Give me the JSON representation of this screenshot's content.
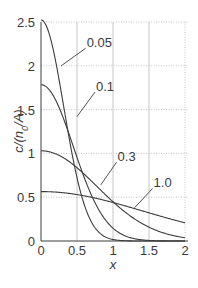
{
  "chart_data": {
    "type": "line",
    "title": "",
    "xlabel": "x",
    "ylabel": "c/(n0/A)",
    "xlim": [
      0,
      2
    ],
    "ylim": [
      0,
      2.5
    ],
    "x_ticks": [
      "0",
      "0.5",
      "1",
      "1.5",
      "2"
    ],
    "y_ticks": [
      "0",
      "0.5",
      "1",
      "1.5",
      "2",
      "2.5"
    ],
    "grid": true,
    "legend": "inline labels",
    "series": [
      {
        "name": "0.05",
        "param": 0.05,
        "peak": 2.52,
        "values_at_x": {
          "0": 2.52,
          "0.25": 1.84,
          "0.5": 0.72,
          "0.75": 0.15,
          "1": 0.02,
          "1.5": 0.0,
          "2": 0.0
        }
      },
      {
        "name": "0.1",
        "param": 0.1,
        "peak": 1.78,
        "values_at_x": {
          "0": 1.78,
          "0.25": 1.52,
          "0.5": 0.95,
          "0.75": 0.43,
          "1": 0.15,
          "1.5": 0.01,
          "2": 0.0
        }
      },
      {
        "name": "0.3",
        "param": 0.3,
        "peak": 1.03,
        "values_at_x": {
          "0": 1.03,
          "0.25": 0.98,
          "0.5": 0.84,
          "0.75": 0.64,
          "1": 0.45,
          "1.5": 0.16,
          "2": 0.04
        }
      },
      {
        "name": "1.0",
        "param": 1.0,
        "peak": 0.56,
        "values_at_x": {
          "0": 0.56,
          "0.25": 0.56,
          "0.5": 0.53,
          "0.75": 0.49,
          "1": 0.44,
          "1.5": 0.32,
          "2": 0.21
        }
      }
    ],
    "annotations": [
      {
        "text": "0.05",
        "leader_from": [
          0.28,
          2.0
        ],
        "label_at": [
          0.62,
          2.2
        ]
      },
      {
        "text": "0.1",
        "leader_from": [
          0.5,
          1.42
        ],
        "label_at": [
          0.75,
          1.7
        ]
      },
      {
        "text": "0.3",
        "leader_from": [
          0.83,
          0.64
        ],
        "label_at": [
          1.05,
          0.9
        ]
      },
      {
        "text": "1.0",
        "leader_from": [
          1.3,
          0.38
        ],
        "label_at": [
          1.55,
          0.6
        ]
      }
    ]
  },
  "labels": {
    "xlabel": "x",
    "ylabel_c": "c/(n",
    "ylabel_sub": "0",
    "ylabel_tail": "/A)",
    "curve_005": "0.05",
    "curve_01": "0.1",
    "curve_03": "0.3",
    "curve_10": "1.0"
  },
  "colors": {
    "curve": "#3d3d3d",
    "grid": "#b8b8b8",
    "axis": "#3d3d3d",
    "text": "#3a3a3a"
  }
}
